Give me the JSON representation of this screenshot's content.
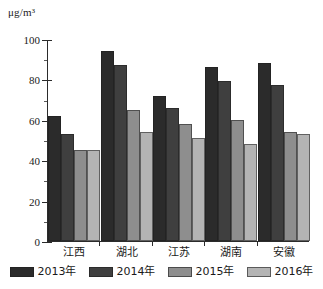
{
  "chart_data": {
    "type": "bar",
    "title": "",
    "subtitle": "",
    "xlabel": "",
    "ylabel": "",
    "unit_label": "μg/m³",
    "categories": [
      "江西",
      "湖北",
      "江苏",
      "湖南",
      "安徽"
    ],
    "series": [
      {
        "name": "2013年",
        "color": "#2b2b2b",
        "values": [
          62,
          94,
          72,
          86,
          88
        ]
      },
      {
        "name": "2014年",
        "color": "#3f3f3f",
        "values": [
          53,
          87,
          66,
          79,
          77
        ]
      },
      {
        "name": "2015年",
        "color": "#8e8e8e",
        "values": [
          45,
          65,
          58,
          60,
          54
        ]
      },
      {
        "name": "2016年",
        "color": "#b4b4b4",
        "values": [
          45,
          54,
          51,
          48,
          53
        ]
      }
    ],
    "ylim": [
      0,
      100
    ],
    "ytick_labels": [
      "0",
      "20",
      "40",
      "60",
      "80",
      "100"
    ],
    "ytick_values": [
      0,
      20,
      40,
      60,
      80,
      100
    ],
    "yminor_values": [
      10,
      30,
      50,
      70,
      90
    ],
    "grid": false,
    "legend_position": "bottom"
  },
  "legend": {
    "items": [
      {
        "label": "2013年",
        "color": "#2b2b2b"
      },
      {
        "label": "2014年",
        "color": "#3f3f3f"
      },
      {
        "label": "2015年",
        "color": "#8e8e8e"
      },
      {
        "label": "2016年",
        "color": "#b4b4b4"
      }
    ]
  }
}
